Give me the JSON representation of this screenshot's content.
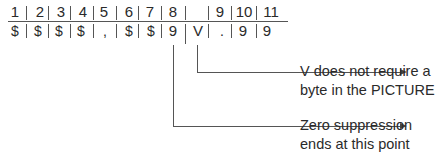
{
  "diagram": {
    "positions": [
      "1",
      "2",
      "3",
      "4",
      "5",
      "6",
      "7",
      "8",
      "",
      "9",
      "10",
      "11"
    ],
    "picture_chars": [
      "$",
      "$",
      "$",
      "$",
      ",",
      "$",
      "$",
      "9",
      "V",
      ".",
      "9",
      "9"
    ],
    "annotations": [
      {
        "target": "V",
        "line1": "V does not require a",
        "line2": "byte in the PICTURE"
      },
      {
        "target": "9",
        "line1": "Zero suppression",
        "line2": "ends at this point"
      }
    ]
  }
}
